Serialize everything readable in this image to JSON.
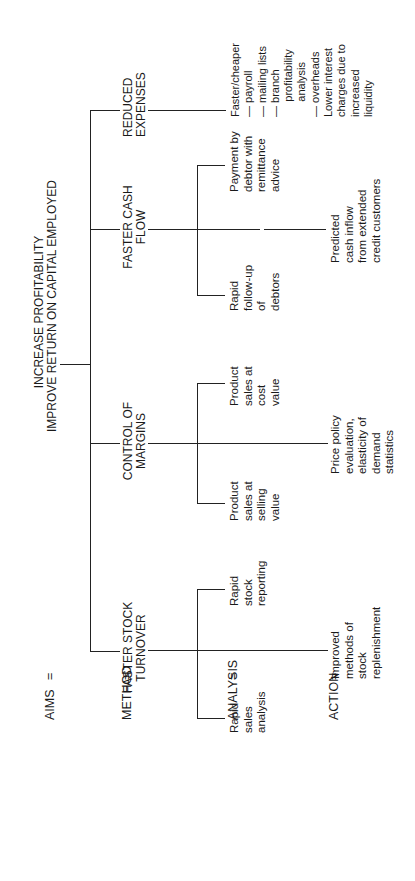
{
  "diagram": {
    "rows": [
      {
        "key": "aims",
        "label": "AIMS",
        "sep": "="
      },
      {
        "key": "method",
        "label": "METHOD",
        "sep": "="
      },
      {
        "key": "analysis",
        "label": "ANALYSIS",
        "sep": "="
      },
      {
        "key": "action",
        "label": "ACTION",
        "sep": "="
      }
    ],
    "aim": "INCREASE PROFITABILITY\nIMPROVE RETURN ON CAPITAL EMPLOYED",
    "methods": [
      {
        "label": "FASTER STOCK\nTURNOVER",
        "analysis": [
          "Rapid\nsales\nanalysis",
          "Rapid\nstock\nreporting"
        ],
        "action": "Improved\nmethods of\nstock\nreplenishment"
      },
      {
        "label": "CONTROL OF\nMARGINS",
        "analysis": [
          "Product\nsales at\nselling\nvalue",
          "Product\nsales at\ncost\nvalue"
        ],
        "action": "Price policy\nevaluation,\nelasticity of\ndemand\nstatistics"
      },
      {
        "label": "FASTER CASH\nFLOW",
        "analysis": [
          "Rapid\nfollow-up\nof\ndebtors",
          "Payment by\ndebtor with\nremittance\nadvice"
        ],
        "action": "Predicted\ncash inflow\nfrom extended\ncredit customers"
      },
      {
        "label": "REDUCED\nEXPENSES",
        "analysis": [],
        "action": "Faster/cheaper\n— payroll\n— mailing lists\n— branch\n     profitability\n     analysis\n— overheads\nLower interest\ncharges due to\nincreased\nliquidity"
      }
    ]
  }
}
